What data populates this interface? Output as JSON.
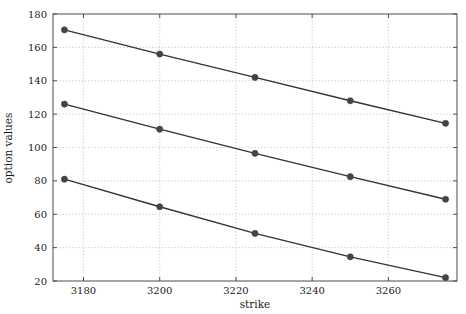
{
  "chart_data": {
    "type": "line",
    "title": "",
    "xlabel": "strike",
    "ylabel": "option values",
    "x": [
      3175,
      3200,
      3225,
      3250,
      3275
    ],
    "series": [
      {
        "name": "series-1",
        "values": [
          170.5,
          156.0,
          142.0,
          128.0,
          114.5
        ]
      },
      {
        "name": "series-2",
        "values": [
          126.0,
          111.0,
          96.5,
          82.5,
          69.0
        ]
      },
      {
        "name": "series-3",
        "values": [
          81.0,
          64.5,
          48.5,
          34.5,
          22.0
        ]
      }
    ],
    "xlim": [
      3172,
      3278
    ],
    "ylim": [
      20,
      180
    ],
    "xticks": [
      3180,
      3200,
      3220,
      3240,
      3260
    ],
    "yticks": [
      20,
      40,
      60,
      80,
      100,
      120,
      140,
      160,
      180
    ],
    "xtick_labels": [
      "3180",
      "3200",
      "3220",
      "3240",
      "3260"
    ],
    "ytick_labels": [
      "20",
      "40",
      "60",
      "80",
      "100",
      "120",
      "140",
      "160",
      "180"
    ],
    "grid": true,
    "grid_style": "dotted",
    "legend": null,
    "marker": "circle",
    "colors": {
      "line": "#333333",
      "marker": "#444444",
      "grid": "#b4b4b4",
      "axis": "#4d4d4d",
      "text": "#1a1a1a",
      "background": "#ffffff"
    }
  },
  "axes": {
    "x_title": "strike",
    "y_title": "option values"
  }
}
